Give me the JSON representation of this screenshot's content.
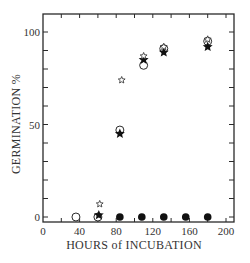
{
  "chart_data": {
    "type": "scatter",
    "title": "",
    "xlabel": "HOURS of INCUBATION",
    "ylabel": "GERMINATION %",
    "xlim": [
      0,
      205
    ],
    "ylim": [
      -3,
      105
    ],
    "x_ticks": [
      0,
      40,
      80,
      120,
      160,
      200
    ],
    "x_minor_ticks": [
      20,
      60,
      100,
      140,
      180
    ],
    "y_ticks": [
      0,
      50,
      100
    ],
    "y_minor_ticks": [
      10,
      20,
      30,
      40,
      60,
      70,
      80,
      90
    ],
    "grid": false,
    "legend": null,
    "series": [
      {
        "name": "open-circle",
        "marker": "open-circle",
        "points": [
          [
            36,
            0
          ],
          [
            60,
            0
          ],
          [
            84,
            47
          ],
          [
            110,
            82
          ],
          [
            132,
            91
          ],
          [
            180,
            95
          ]
        ]
      },
      {
        "name": "filled-star",
        "marker": "filled-star",
        "points": [
          [
            61,
            1
          ],
          [
            84,
            45
          ],
          [
            110,
            85
          ],
          [
            132,
            89
          ],
          [
            180,
            92
          ]
        ]
      },
      {
        "name": "open-star",
        "marker": "open-star",
        "points": [
          [
            62,
            7
          ],
          [
            86,
            74
          ],
          [
            110,
            87
          ],
          [
            132,
            92
          ],
          [
            180,
            96
          ]
        ]
      },
      {
        "name": "filled-circle",
        "marker": "filled-circle",
        "points": [
          [
            84,
            0
          ],
          [
            108,
            0
          ],
          [
            132,
            0
          ],
          [
            156,
            0
          ],
          [
            180,
            0
          ]
        ]
      }
    ]
  },
  "labels": {
    "x_axis_title": "HOURS of INCUBATION",
    "y_axis_title": "GERMINATION %"
  },
  "colors": {
    "ink": "#2a2a2a",
    "background": "#ffffff"
  }
}
